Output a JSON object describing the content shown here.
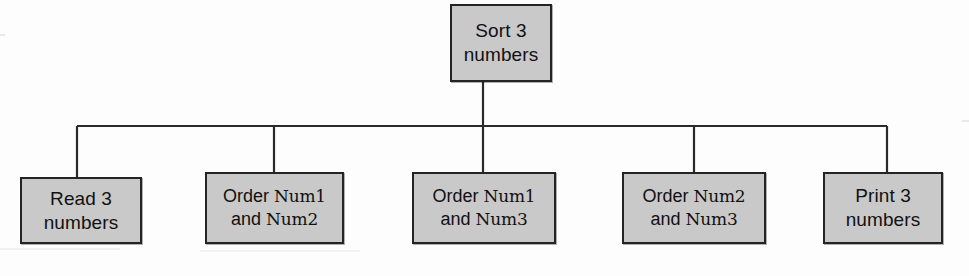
{
  "diagram": {
    "type": "structure-chart",
    "colors": {
      "box_fill": "#c9c9c9",
      "box_border": "#242424",
      "connector": "#2a2a2a",
      "background": "#fdfdfd",
      "text": "#111111"
    },
    "root": {
      "id": "sort-3-numbers",
      "line1": "Sort 3",
      "line2": "numbers",
      "x": 450,
      "y": 4,
      "w": 102,
      "h": 78
    },
    "bus": {
      "y": 126,
      "x_start": 77,
      "x_end": 887
    },
    "children": [
      {
        "id": "read-3-numbers",
        "style": "plain",
        "line1": "Read 3",
        "line2": "numbers",
        "x": 20,
        "y": 177,
        "w": 122,
        "h": 67,
        "drop_x": 77
      },
      {
        "id": "order-num1-num2",
        "style": "mixed",
        "line1_prefix": "Order ",
        "line1_var": "Num1",
        "line2_prefix": "and ",
        "line2_var": "Num2",
        "x": 205,
        "y": 172,
        "w": 139,
        "h": 72,
        "drop_x": 274
      },
      {
        "id": "order-num1-num3",
        "style": "mixed",
        "line1_prefix": "Order ",
        "line1_var": "Num1",
        "line2_prefix": "and ",
        "line2_var": "Num3",
        "x": 412,
        "y": 172,
        "w": 144,
        "h": 72,
        "drop_x": 483
      },
      {
        "id": "order-num2-num3",
        "style": "mixed",
        "line1_prefix": "Order ",
        "line1_var": "Num2",
        "line2_prefix": "and ",
        "line2_var": "Num3",
        "x": 622,
        "y": 172,
        "w": 144,
        "h": 72,
        "drop_x": 694
      },
      {
        "id": "print-3-numbers",
        "style": "plain",
        "line1": "Print 3",
        "line2": "numbers",
        "x": 823,
        "y": 172,
        "w": 120,
        "h": 72,
        "drop_x": 887
      }
    ]
  }
}
